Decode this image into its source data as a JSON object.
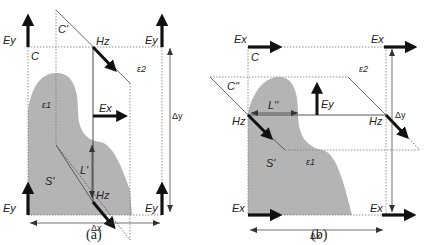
{
  "figure": {
    "panels": [
      {
        "id": "a",
        "caption": "(a)",
        "labels": {
          "ey_top_left": "Ey",
          "ey_top_right": "Ey",
          "ey_bottom_left": "Ey",
          "ey_bottom_right": "Ey",
          "contour_c": "C",
          "contour_c_prime": "C'",
          "hz_top": "Hz",
          "hz_bottom": "Hz",
          "ex_center": "Ex",
          "eps1": "ε1",
          "eps2": "ε2",
          "surface": "S'",
          "length": "L'",
          "delta_x": "Δx",
          "delta_y": "Δy"
        }
      },
      {
        "id": "b",
        "caption": "(b)",
        "labels": {
          "ex_top_left": "Ex",
          "ex_top_right": "Ex",
          "ex_bottom_left": "Ex",
          "ex_bottom_right": "Ex",
          "contour_c": "C",
          "contour_c_dprime": "C''",
          "hz_left": "Hz",
          "hz_right": "Hz",
          "ey_center": "Ey",
          "eps1": "ε1",
          "eps2": "ε2",
          "surface": "S'",
          "length": "L''",
          "delta_x": "Δx",
          "delta_y": "Δy"
        }
      }
    ],
    "colors": {
      "region_fill": "#b4b4b4",
      "line": "#222222",
      "dotted": "#777777",
      "background": "#ffffff"
    }
  }
}
